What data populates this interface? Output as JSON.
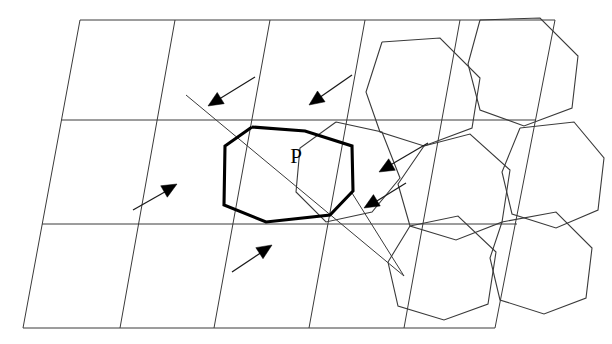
{
  "figure": {
    "background_color": "#ffffff",
    "line_color": "#3a3a3a",
    "bold_color": "#000000",
    "width": 612,
    "height": 344
  },
  "labels": {
    "p_label": "P",
    "p_label_x": 296,
    "p_label_y": 163
  },
  "grid": {
    "description": "Sheared parallelogram lattice",
    "outline": "80,20 555,20 495,328 23,328",
    "near_vertical_lines": [
      "80,20 23,328",
      "175,20 120,328",
      "270,20 214,328",
      "365,20 309,328",
      "460,20 404,328",
      "555,20 495,328"
    ],
    "near_horizontal_lines": [
      "80,20 555,20",
      "61,120 536,120",
      "42,224 517,224",
      "23,328 495,328"
    ]
  },
  "cells": {
    "description": "Octagonal / hexagonal Voronoi-like cells overlaid on the right half",
    "paths": [
      "382,42 440,38 480,78 472,128 424,146 380,132 366,92 382,42",
      "480,20 540,18 578,56 572,108 524,126 480,110 468,64 480,20",
      "424,146 470,134 510,170 502,222 456,240 410,226 398,184 424,146",
      "520,128 574,122 604,158 598,210 556,228 512,214 502,172 520,128",
      "410,226 458,216 496,252 488,304 444,320 398,306 388,262 410,226",
      "502,222 556,212 592,248 586,298 544,314 500,300 490,258 502,222",
      "336,122 382,132 400,178 372,212 326,222 296,192 300,148 336,122"
    ]
  },
  "bold_polygon": {
    "name": "polygon-P",
    "points": "252,127 225,146 224,205 266,222 330,215 353,191 352,146 305,131 252,127"
  },
  "diagonals": [
    {
      "name": "diagonal-upper-left-to-lower-right",
      "from": [
        186,
        95
      ],
      "to": [
        404,
        276
      ]
    },
    {
      "name": "diagonal-short-lower",
      "from": [
        352,
        193
      ],
      "to": [
        404,
        276
      ]
    }
  ],
  "arrows": [
    {
      "name": "arrow-1-top-left",
      "shaft_from": [
        255,
        77
      ],
      "shaft_to": [
        216,
        101
      ],
      "head_at": [
        208,
        106
      ],
      "angle_deg": 148
    },
    {
      "name": "arrow-2-top-middle",
      "shaft_from": [
        352,
        75
      ],
      "shaft_to": [
        316,
        100
      ],
      "head_at": [
        309,
        105
      ],
      "angle_deg": 145
    },
    {
      "name": "arrow-3-right-upper",
      "shaft_from": [
        428,
        143
      ],
      "shaft_to": [
        387,
        167
      ],
      "head_at": [
        379,
        172
      ],
      "angle_deg": 150
    },
    {
      "name": "arrow-4-right-lower",
      "shaft_from": [
        406,
        183
      ],
      "shaft_to": [
        372,
        204
      ],
      "head_at": [
        364,
        208
      ],
      "angle_deg": 149
    },
    {
      "name": "arrow-5-left",
      "shaft_from": [
        133,
        210
      ],
      "shaft_to": [
        170,
        189
      ],
      "head_at": [
        177,
        184
      ],
      "angle_deg": -30
    },
    {
      "name": "arrow-6-bottom",
      "shaft_from": [
        232,
        272
      ],
      "shaft_to": [
        265,
        250
      ],
      "head_at": [
        272,
        245
      ],
      "angle_deg": -33
    }
  ]
}
